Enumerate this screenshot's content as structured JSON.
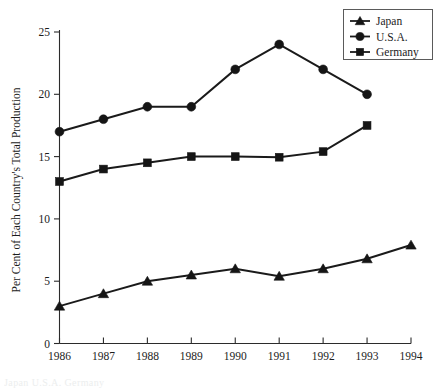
{
  "chart_data": {
    "type": "line",
    "title": "",
    "subtitle": "",
    "xlabel": "",
    "ylabel": "Per Cent of Each Country's Total Production",
    "x": [
      1986,
      1987,
      1988,
      1989,
      1990,
      1991,
      1992,
      1993,
      1994
    ],
    "xtick_labels": [
      "1986",
      "1987",
      "1988",
      "1989",
      "1990",
      "1991",
      "1992",
      "1993",
      "1994"
    ],
    "ytick_labels": [
      "0",
      "5",
      "10",
      "15",
      "20",
      "25"
    ],
    "yticks": [
      0,
      5,
      10,
      15,
      20,
      25
    ],
    "ylim": [
      0,
      25.6
    ],
    "xlim": [
      1986,
      1994
    ],
    "grid": false,
    "legend_position": "top-right",
    "series": [
      {
        "name": "Japan",
        "marker": "triangle",
        "color": "#151515",
        "x": [
          1986,
          1987,
          1988,
          1989,
          1990,
          1991,
          1992,
          1993,
          1994
        ],
        "values": [
          3.0,
          4.0,
          5.0,
          5.5,
          6.0,
          5.4,
          6.0,
          6.8,
          7.9
        ]
      },
      {
        "name": "U.S.A.",
        "marker": "circle",
        "color": "#151515",
        "x": [
          1986,
          1987,
          1988,
          1989,
          1990,
          1991,
          1992,
          1993
        ],
        "values": [
          17.0,
          18.0,
          19.0,
          19.0,
          22.0,
          24.0,
          22.0,
          20.0
        ]
      },
      {
        "name": "Germany",
        "marker": "square",
        "color": "#151515",
        "x": [
          1986,
          1987,
          1988,
          1989,
          1990,
          1991,
          1992,
          1993
        ],
        "values": [
          13.0,
          14.0,
          14.5,
          15.0,
          15.0,
          14.95,
          15.4,
          17.5
        ]
      }
    ]
  },
  "legend": {
    "entries": [
      {
        "label": "Japan",
        "marker": "triangle"
      },
      {
        "label": "U.S.A.",
        "marker": "circle"
      },
      {
        "label": "Germany",
        "marker": "square"
      }
    ]
  },
  "axis": {
    "y_title": "Per Cent of Each Country's Total Production",
    "y_ticks": [
      "25",
      "20",
      "15",
      "10",
      "5",
      "0"
    ],
    "x_ticks": [
      "1986",
      "1987",
      "1988",
      "1989",
      "1990",
      "1991",
      "1992",
      "1993",
      "1994"
    ]
  },
  "footer": {
    "ghost_text": "Japan U.S.A. Germany"
  }
}
